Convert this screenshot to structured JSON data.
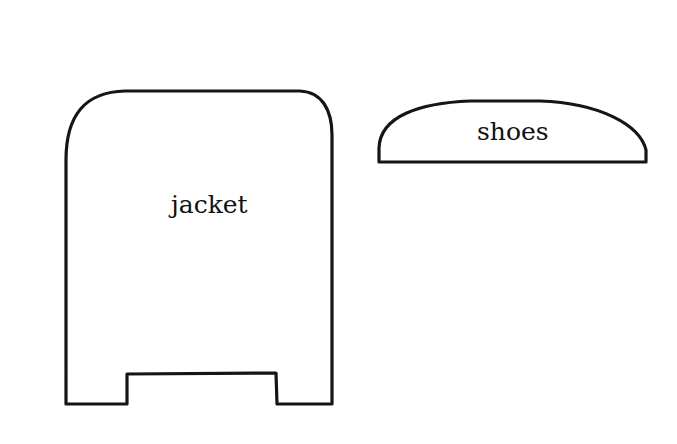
{
  "diagram": {
    "shapes": [
      {
        "id": "jacket",
        "label": "jacket"
      },
      {
        "id": "shoes",
        "label": "shoes"
      }
    ],
    "colors": {
      "stroke": "#151515",
      "background": "#ffffff",
      "text": "#111111"
    }
  }
}
